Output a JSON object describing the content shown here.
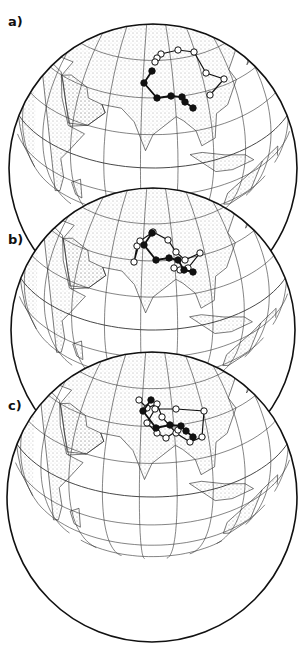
{
  "figure": {
    "panels": [
      {
        "id": "a",
        "label": "a)",
        "label_pos": [
          8,
          14
        ],
        "globe": {
          "cx": 153,
          "cy": 168,
          "r": 144
        },
        "tracks": [
          {
            "style": "open",
            "points": [
              [
                210,
                95
              ],
              [
                224,
                79
              ],
              [
                206,
                73
              ],
              [
                194,
                52
              ],
              [
                178,
                50
              ],
              [
                161,
                54
              ],
              [
                157,
                58
              ],
              [
                155,
                62
              ]
            ]
          },
          {
            "style": "filled",
            "points": [
              [
                152,
                71
              ],
              [
                144,
                83
              ],
              [
                157,
                98
              ],
              [
                171,
                96
              ],
              [
                182,
                97
              ],
              [
                185,
                102
              ],
              [
                193,
                108
              ]
            ]
          }
        ]
      },
      {
        "id": "b",
        "label": "b)",
        "label_pos": [
          8,
          232
        ],
        "globe": {
          "cx": 153,
          "cy": 330,
          "r": 142
        },
        "tracks": [
          {
            "style": "open",
            "points": [
              [
                137,
                246
              ],
              [
                134,
                262
              ],
              [
                140,
                241
              ],
              [
                153,
                232
              ],
              [
                168,
                240
              ],
              [
                176,
                252
              ],
              [
                185,
                260
              ],
              [
                200,
                253
              ],
              [
                188,
                268
              ],
              [
                180,
                270
              ],
              [
                174,
                268
              ]
            ]
          },
          {
            "style": "filled",
            "points": [
              [
                152,
                233
              ],
              [
                144,
                245
              ],
              [
                156,
                260
              ],
              [
                169,
                258
              ],
              [
                178,
                260
              ],
              [
                184,
                270
              ],
              [
                193,
                272
              ]
            ]
          }
        ]
      },
      {
        "id": "c",
        "label": "c)",
        "label_pos": [
          8,
          398
        ],
        "globe": {
          "cx": 152,
          "cy": 497,
          "r": 145
        },
        "tracks": [
          {
            "style": "open",
            "points": [
              [
                139,
                400
              ],
              [
                147,
                408
              ],
              [
                157,
                404
              ],
              [
                162,
                417
              ],
              [
                176,
                433
              ],
              [
                190,
                442
              ],
              [
                202,
                437
              ],
              [
                204,
                411
              ],
              [
                176,
                409
              ],
              [
                155,
                409
              ],
              [
                147,
                423
              ],
              [
                157,
                433
              ],
              [
                166,
                438
              ],
              [
                178,
                430
              ]
            ]
          },
          {
            "style": "filled",
            "points": [
              [
                151,
                400
              ],
              [
                143,
                411
              ],
              [
                156,
                428
              ],
              [
                170,
                425
              ],
              [
                181,
                426
              ],
              [
                186,
                431
              ],
              [
                193,
                437
              ]
            ]
          }
        ]
      }
    ],
    "legend": {
      "filled_marker": "filled circle",
      "open_marker": "open circle"
    },
    "colors": {
      "ink": "#111111",
      "grid": "#333333",
      "land_stipple": "#555555",
      "ocean": "#ffffff"
    }
  }
}
